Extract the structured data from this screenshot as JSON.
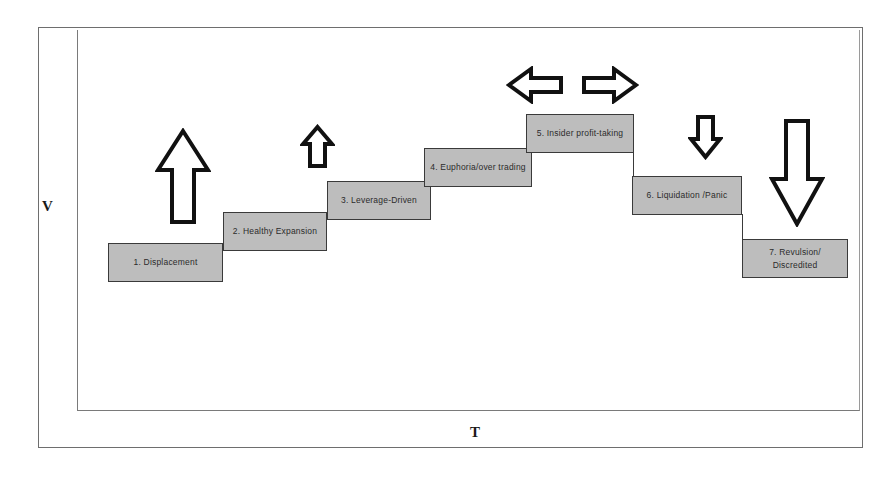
{
  "diagram": {
    "axes": {
      "y_label": "V",
      "x_label": "T"
    },
    "style": {
      "box_fill": "#bdbdbd",
      "box_border": "#3a3a3a",
      "frame_color": "#6e6e6e",
      "arrow_outline": "#111111",
      "arrow_fill": "#ffffff",
      "background": "#ffffff"
    },
    "steps": [
      {
        "id": 1,
        "label": "1. Displacement",
        "x": 108,
        "y": 243,
        "w": 115,
        "h": 39
      },
      {
        "id": 2,
        "label": "2. Healthy Expansion",
        "x": 223,
        "y": 212,
        "w": 104,
        "h": 39
      },
      {
        "id": 3,
        "label": "3. Leverage-Driven",
        "x": 327,
        "y": 181,
        "w": 104,
        "h": 39
      },
      {
        "id": 4,
        "label": "4. Euphoria/over trading",
        "x": 424,
        "y": 148,
        "w": 108,
        "h": 39
      },
      {
        "id": 5,
        "label": "5. Insider profit-taking",
        "x": 526,
        "y": 114,
        "w": 108,
        "h": 39
      },
      {
        "id": 6,
        "label": "6. Liquidation /Panic",
        "x": 632,
        "y": 176,
        "w": 110,
        "h": 39
      },
      {
        "id": 7,
        "label": "7. Revulsion/ Discredited",
        "x": 742,
        "y": 239,
        "w": 106,
        "h": 39
      }
    ],
    "arrows": [
      {
        "name": "arrow-up-large",
        "direction": "up",
        "x": 155,
        "y": 128,
        "w": 56,
        "h": 97
      },
      {
        "name": "arrow-up-small",
        "direction": "up",
        "x": 300,
        "y": 124,
        "w": 35,
        "h": 45
      },
      {
        "name": "arrow-left",
        "direction": "left",
        "x": 506,
        "y": 66,
        "w": 58,
        "h": 38
      },
      {
        "name": "arrow-right",
        "direction": "right",
        "x": 581,
        "y": 66,
        "w": 58,
        "h": 38
      },
      {
        "name": "arrow-down-small",
        "direction": "down",
        "x": 688,
        "y": 113,
        "w": 35,
        "h": 47
      },
      {
        "name": "arrow-down-large",
        "direction": "down",
        "x": 769,
        "y": 117,
        "w": 56,
        "h": 110
      }
    ]
  }
}
